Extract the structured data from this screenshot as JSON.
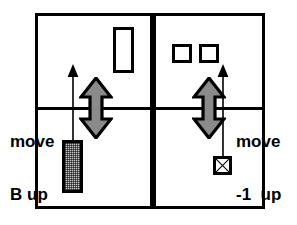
{
  "figure": {
    "name": "two-panel-move-diagram",
    "background_color": "#ffffff",
    "stroke_color": "#000000",
    "fill_gray": "#c8c8c8"
  },
  "panels": [
    {
      "id": "left-panel",
      "caption_lines": [
        "move",
        "B up"
      ],
      "objects": [
        {
          "name": "open-tall-rectangle",
          "fill": "white"
        },
        {
          "name": "hatched-tall-rectangle",
          "fill": "gray-stipple"
        }
      ],
      "arrows": [
        {
          "name": "thin-up-arrow",
          "direction": "up"
        },
        {
          "name": "bold-double-arrow",
          "direction": "up-down"
        }
      ]
    },
    {
      "id": "right-panel",
      "caption_lines": [
        "move",
        "-1  up"
      ],
      "objects": [
        {
          "name": "open-square-left",
          "fill": "white"
        },
        {
          "name": "open-square-right",
          "fill": "white"
        },
        {
          "name": "crossed-square",
          "fill": "white-with-x"
        }
      ],
      "arrows": [
        {
          "name": "thin-up-arrow",
          "direction": "up"
        },
        {
          "name": "bold-double-arrow",
          "direction": "up-down"
        }
      ]
    }
  ],
  "captions": {
    "left_line1": "move",
    "left_line2": "B up",
    "right_line1": "move",
    "right_line2": "-1  up"
  },
  "icons": {
    "double_arrow": "double-headed-vertical-arrow-icon",
    "thin_arrow": "thin-up-arrow-icon",
    "cross_box": "crossed-box-icon"
  }
}
